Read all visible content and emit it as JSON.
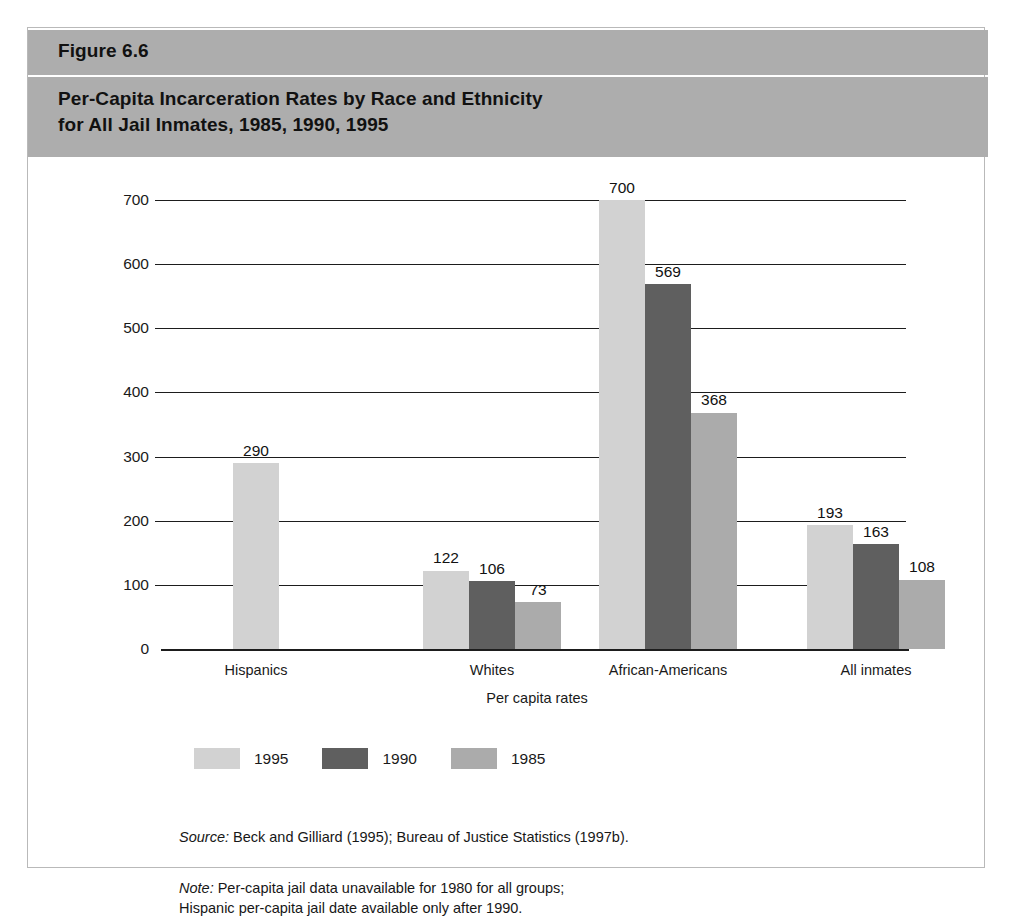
{
  "figure": {
    "number": "Figure 6.6",
    "title": "Per-Capita Incarceration Rates by Race and Ethnicity\nfor All Jail Inmates, 1985, 1990, 1995"
  },
  "footnotes": {
    "source_key": "Source:",
    "source_text": " Beck and Gilliard (1995); Bureau of Justice Statistics (1997b).",
    "note_key": "Note:",
    "note_text": " Per-capita jail data unavailable for 1980 for all groups;\nHispanic per-capita jail date available only after 1990."
  },
  "colors": {
    "header_band": "#adadad",
    "series_1995": "#d2d2d2",
    "series_1990": "#5f5f5f",
    "series_1985": "#ababab",
    "axis": "#1d1d1d",
    "frame": "#b9b9b9"
  },
  "chart_data": {
    "type": "bar",
    "title": "Per-Capita Incarceration Rates by Race and Ethnicity for All Jail Inmates, 1985, 1990, 1995",
    "xlabel": "Per capita rates",
    "ylabel": "",
    "categories": [
      "Hispanics",
      "Whites",
      "African-Americans",
      "All inmates"
    ],
    "series": [
      {
        "name": "1995",
        "color": "#d2d2d2",
        "values": [
          290,
          122,
          700,
          193
        ]
      },
      {
        "name": "1990",
        "color": "#5f5f5f",
        "values": [
          null,
          106,
          569,
          163
        ]
      },
      {
        "name": "1985",
        "color": "#ababab",
        "values": [
          null,
          73,
          368,
          108
        ]
      }
    ],
    "ylim": [
      0,
      700
    ],
    "yticks": [
      0,
      100,
      200,
      300,
      400,
      500,
      600,
      700
    ],
    "ytick_labels": [
      "0",
      "100",
      "200",
      "300",
      "400",
      "500",
      "600",
      "700"
    ],
    "grid": true,
    "legend_position": "bottom-left",
    "data_labels": true
  }
}
